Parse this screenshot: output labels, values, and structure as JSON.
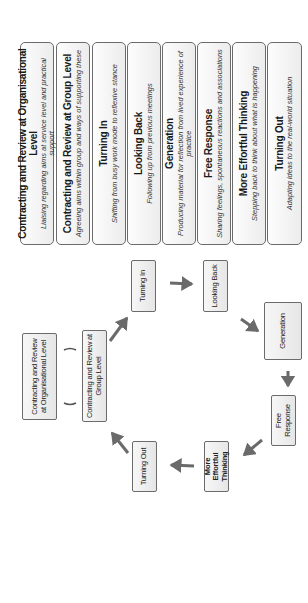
{
  "orientation": "rotated 90deg counter-clockwise",
  "stages": [
    {
      "title": "Contracting and Review at Organisational Level",
      "description": "Liaising regarding aims at service level and practical support"
    },
    {
      "title": "Contracting and Review at Group Level",
      "description": "Agreeing aims within group and ways of supporting these"
    },
    {
      "title": "Turning In",
      "description": "Shifting from busy work mode to reflexive stance"
    },
    {
      "title": "Looking Back",
      "description": "Following up from previous meetings"
    },
    {
      "title": "Generation",
      "description": "Producing material for reflection from lived experience of practice"
    },
    {
      "title": "Free Response",
      "description": "Sharing feelings, spontaneous reactions and associations"
    },
    {
      "title": "More Effortful Thinking",
      "description": "Stepping back to think about what is happening"
    },
    {
      "title": "Turning Out",
      "description": "Adapting ideas to the real-world situation"
    }
  ],
  "cycle": {
    "nodes": {
      "org_level": "Contracting and Review at Organisational Level",
      "group_level": "Contracting and Review at Group Level",
      "turning_in": "Turning In",
      "looking_back": "Looking Back",
      "generation": "Generation",
      "free_response": "Free Response",
      "more_effortful": "More Effortful Thinking",
      "turning_out": "Turning Out"
    },
    "flow": [
      "Contracting and Review at Group Level",
      "Turning In",
      "Looking Back",
      "Generation",
      "Free Response",
      "More Effortful Thinking",
      "Turning Out",
      "Contracting and Review at Group Level"
    ],
    "link": "Contracting and Review at Organisational Level ( ) Contracting and Review at Group Level",
    "colors": {
      "box_border": "#6b6b6b",
      "box_fill": "#ececec",
      "arrow": "#6a6a6a"
    }
  }
}
